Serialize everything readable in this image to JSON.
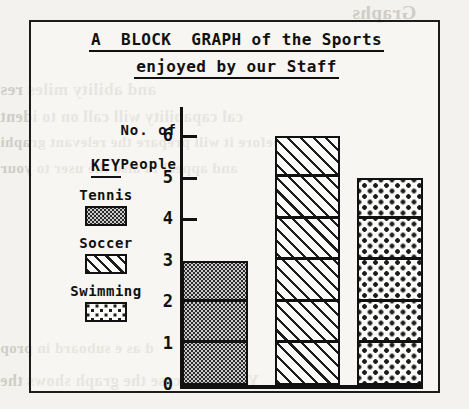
{
  "chart_data": {
    "type": "bar",
    "title": "A BLOCK GRAPH of the Sports enjoyed by our Staff",
    "title_line1": "A  BLOCK  GRAPH of the Sports",
    "title_line2": "enjoyed by our Staff",
    "categories": [
      "Tennis",
      "Soccer",
      "Swimming"
    ],
    "values": [
      3,
      6,
      5
    ],
    "xlabel": "",
    "ylabel": "No. of People",
    "ylabel_line1": "No. of",
    "ylabel_line2": "People",
    "ylim": [
      0,
      6
    ],
    "yticks": [
      "6",
      "5",
      "4",
      "3",
      "2",
      "1",
      "0"
    ],
    "ytick_values": [
      6,
      5,
      4,
      3,
      2,
      1,
      0
    ],
    "grid": false,
    "legend_position": "left",
    "legend_title": "KEY",
    "block_units": true,
    "series": [
      {
        "name": "Tennis",
        "value": 3,
        "pattern": "dense-stipple",
        "color": "#cbcbcb"
      },
      {
        "name": "Soccer",
        "value": 6,
        "pattern": "diagonal-hatch",
        "color": "#ffffff"
      },
      {
        "name": "Swimming",
        "value": 5,
        "pattern": "sparse-dots",
        "color": "#ffffff"
      }
    ]
  },
  "legend": {
    "title": "KEY",
    "items": [
      {
        "label": "Tennis",
        "pattern": "dense-stipple"
      },
      {
        "label": "Soccer",
        "pattern": "diagonal-hatch"
      },
      {
        "label": "Swimming",
        "pattern": "sparse-dots"
      }
    ]
  },
  "colors": {
    "ink": "#111111",
    "paper": "#f3f2ee",
    "stipple_fill": "#cbcbcb",
    "bleed_text": "#cfcdc6"
  },
  "background_bleed": [
    {
      "text": "Graphs",
      "x": 352,
      "y": 2,
      "size": 19
    },
    {
      "text": "and  ability    miles  res",
      "x": 0,
      "y": 80,
      "size": 17
    },
    {
      "text": "cal capability will call on to ident",
      "x": 0,
      "y": 108,
      "size": 16
    },
    {
      "text": "before it will prepare the relevant graphi",
      "x": 0,
      "y": 134,
      "size": 15
    },
    {
      "text": "and appeal to also the user to your",
      "x": 0,
      "y": 160,
      "size": 15
    },
    {
      "text": "eu",
      "x": 300,
      "y": 244,
      "size": 16
    },
    {
      "text": "d  as   e                   suboard in prop",
      "x": 0,
      "y": 340,
      "size": 15
    },
    {
      "text": "Yet in this case the graph shows the",
      "x": 0,
      "y": 372,
      "size": 16
    }
  ]
}
